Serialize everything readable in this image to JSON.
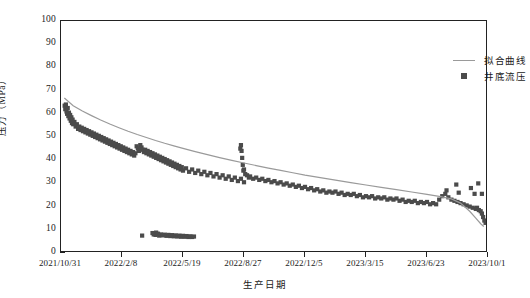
{
  "chart_data": {
    "type": "scatter",
    "title": "",
    "xlabel": "生产日期",
    "ylabel": "压力（MPa）",
    "ylim": [
      0,
      100
    ],
    "ytick_labels": [
      "0",
      "10",
      "20",
      "30",
      "40",
      "50",
      "60",
      "70",
      "80",
      "90",
      "100"
    ],
    "ytick_values": [
      0,
      10,
      20,
      30,
      40,
      50,
      60,
      70,
      80,
      90,
      100
    ],
    "xtick_labels": [
      "2021/10/31",
      "2022/2/8",
      "2022/5/19",
      "2022/8/27",
      "2022/12/5",
      "2023/3/15",
      "2023/6/23",
      "2023/10/1"
    ],
    "xtick_positions": [
      0,
      1,
      2,
      3,
      4,
      5,
      6,
      7
    ],
    "grid": false,
    "legend_position": "top-right",
    "colors": {
      "marker": "#4b4b4b",
      "fit_line": "#9a9a9a",
      "axis": "#222222"
    },
    "series": [
      {
        "name": "拟合曲线",
        "type": "line",
        "color": "#9a9a9a",
        "points": [
          [
            0.055,
            66.8
          ],
          [
            0.2,
            63.5
          ],
          [
            0.35,
            61.2
          ],
          [
            0.5,
            59.2
          ],
          [
            0.65,
            57.3
          ],
          [
            0.8,
            55.6
          ],
          [
            0.95,
            54.0
          ],
          [
            1.1,
            52.5
          ],
          [
            1.25,
            51.1
          ],
          [
            1.4,
            49.8
          ],
          [
            1.55,
            48.5
          ],
          [
            1.7,
            47.3
          ],
          [
            1.85,
            46.2
          ],
          [
            2.0,
            45.1
          ],
          [
            2.2,
            43.7
          ],
          [
            2.4,
            42.4
          ],
          [
            2.6,
            41.1
          ],
          [
            2.8,
            39.9
          ],
          [
            3.0,
            38.8
          ],
          [
            3.2,
            37.7
          ],
          [
            3.4,
            36.6
          ],
          [
            3.6,
            35.6
          ],
          [
            3.8,
            34.6
          ],
          [
            4.0,
            33.6
          ],
          [
            4.25,
            32.5
          ],
          [
            4.5,
            31.4
          ],
          [
            4.75,
            30.3
          ],
          [
            5.0,
            29.3
          ],
          [
            5.25,
            28.3
          ],
          [
            5.5,
            27.3
          ],
          [
            5.75,
            26.3
          ],
          [
            6.0,
            25.3
          ],
          [
            6.2,
            24.4
          ],
          [
            6.4,
            23.3
          ],
          [
            6.55,
            21.5
          ],
          [
            6.7,
            18.0
          ],
          [
            6.8,
            15.0
          ],
          [
            6.88,
            12.6
          ],
          [
            6.93,
            11.4
          ]
        ]
      },
      {
        "name": "井底流压",
        "type": "scatter",
        "color": "#4b4b4b",
        "marker": "square",
        "points": [
          [
            0.06,
            63.5
          ],
          [
            0.07,
            62.0
          ],
          [
            0.08,
            64.0
          ],
          [
            0.09,
            61.0
          ],
          [
            0.1,
            60.0
          ],
          [
            0.11,
            62.5
          ],
          [
            0.12,
            59.0
          ],
          [
            0.13,
            60.5
          ],
          [
            0.14,
            58.0
          ],
          [
            0.15,
            59.5
          ],
          [
            0.16,
            57.0
          ],
          [
            0.17,
            58.5
          ],
          [
            0.18,
            56.0
          ],
          [
            0.19,
            57.5
          ],
          [
            0.2,
            55.5
          ],
          [
            0.22,
            56.5
          ],
          [
            0.24,
            54.5
          ],
          [
            0.26,
            55.5
          ],
          [
            0.28,
            53.5
          ],
          [
            0.3,
            54.5
          ],
          [
            0.32,
            53.0
          ],
          [
            0.34,
            54.0
          ],
          [
            0.36,
            52.5
          ],
          [
            0.38,
            53.5
          ],
          [
            0.4,
            52.0
          ],
          [
            0.42,
            53.0
          ],
          [
            0.44,
            51.5
          ],
          [
            0.46,
            52.5
          ],
          [
            0.48,
            51.0
          ],
          [
            0.5,
            52.0
          ],
          [
            0.52,
            50.5
          ],
          [
            0.54,
            51.5
          ],
          [
            0.56,
            50.0
          ],
          [
            0.58,
            51.0
          ],
          [
            0.6,
            49.5
          ],
          [
            0.62,
            50.5
          ],
          [
            0.64,
            49.0
          ],
          [
            0.66,
            50.0
          ],
          [
            0.68,
            48.5
          ],
          [
            0.7,
            49.5
          ],
          [
            0.72,
            48.0
          ],
          [
            0.74,
            49.0
          ],
          [
            0.76,
            47.5
          ],
          [
            0.78,
            48.5
          ],
          [
            0.8,
            47.0
          ],
          [
            0.82,
            48.0
          ],
          [
            0.84,
            46.5
          ],
          [
            0.86,
            47.5
          ],
          [
            0.88,
            46.0
          ],
          [
            0.9,
            47.0
          ],
          [
            0.92,
            45.5
          ],
          [
            0.94,
            46.5
          ],
          [
            0.96,
            45.0
          ],
          [
            0.98,
            46.0
          ],
          [
            1.0,
            44.5
          ],
          [
            1.02,
            45.5
          ],
          [
            1.04,
            44.0
          ],
          [
            1.06,
            45.0
          ],
          [
            1.08,
            43.5
          ],
          [
            1.1,
            44.5
          ],
          [
            1.12,
            43.0
          ],
          [
            1.14,
            44.0
          ],
          [
            1.16,
            42.5
          ],
          [
            1.18,
            43.5
          ],
          [
            1.2,
            42.0
          ],
          [
            1.22,
            43.0
          ],
          [
            1.24,
            46.0
          ],
          [
            1.26,
            45.0
          ],
          [
            1.28,
            44.0
          ],
          [
            1.3,
            46.5
          ],
          [
            1.32,
            45.5
          ],
          [
            1.34,
            44.5
          ],
          [
            1.36,
            43.5
          ],
          [
            1.38,
            44.5
          ],
          [
            1.4,
            43.0
          ],
          [
            1.42,
            44.0
          ],
          [
            1.44,
            42.5
          ],
          [
            1.46,
            43.5
          ],
          [
            1.48,
            42.0
          ],
          [
            1.5,
            43.0
          ],
          [
            1.52,
            41.5
          ],
          [
            1.54,
            42.5
          ],
          [
            1.56,
            41.0
          ],
          [
            1.58,
            42.0
          ],
          [
            1.6,
            40.5
          ],
          [
            1.62,
            41.5
          ],
          [
            1.64,
            40.0
          ],
          [
            1.66,
            41.0
          ],
          [
            1.68,
            39.5
          ],
          [
            1.7,
            40.5
          ],
          [
            1.72,
            39.0
          ],
          [
            1.74,
            40.0
          ],
          [
            1.76,
            38.5
          ],
          [
            1.78,
            39.5
          ],
          [
            1.8,
            38.0
          ],
          [
            1.82,
            39.0
          ],
          [
            1.84,
            37.5
          ],
          [
            1.86,
            38.5
          ],
          [
            1.88,
            37.0
          ],
          [
            1.9,
            38.0
          ],
          [
            1.92,
            36.5
          ],
          [
            1.94,
            37.5
          ],
          [
            1.96,
            36.0
          ],
          [
            1.98,
            37.0
          ],
          [
            2.0,
            35.5
          ],
          [
            2.05,
            36.5
          ],
          [
            2.1,
            35.0
          ],
          [
            2.15,
            36.0
          ],
          [
            2.2,
            34.5
          ],
          [
            2.25,
            35.5
          ],
          [
            2.3,
            34.0
          ],
          [
            2.35,
            35.0
          ],
          [
            2.4,
            33.5
          ],
          [
            2.45,
            34.5
          ],
          [
            2.5,
            33.0
          ],
          [
            2.55,
            34.0
          ],
          [
            2.6,
            32.5
          ],
          [
            2.65,
            33.5
          ],
          [
            2.7,
            32.0
          ],
          [
            2.75,
            33.0
          ],
          [
            2.8,
            31.5
          ],
          [
            2.85,
            32.5
          ],
          [
            2.9,
            31.0
          ],
          [
            2.95,
            32.0
          ],
          [
            3.0,
            30.5
          ],
          [
            2.96,
            44.0
          ],
          [
            2.97,
            41.0
          ],
          [
            2.98,
            38.0
          ],
          [
            2.99,
            35.5
          ],
          [
            2.95,
            46.5
          ],
          [
            2.94,
            45.0
          ],
          [
            3.0,
            36.0
          ],
          [
            3.02,
            34.0
          ],
          [
            3.05,
            33.5
          ],
          [
            3.08,
            32.5
          ],
          [
            3.1,
            33.0
          ],
          [
            3.15,
            32.0
          ],
          [
            3.2,
            32.5
          ],
          [
            3.25,
            31.5
          ],
          [
            3.3,
            32.0
          ],
          [
            3.35,
            31.0
          ],
          [
            3.4,
            31.5
          ],
          [
            3.45,
            30.5
          ],
          [
            3.5,
            31.0
          ],
          [
            3.55,
            30.0
          ],
          [
            3.6,
            30.5
          ],
          [
            3.65,
            29.5
          ],
          [
            3.7,
            30.0
          ],
          [
            3.75,
            29.0
          ],
          [
            3.8,
            29.5
          ],
          [
            3.85,
            28.5
          ],
          [
            3.9,
            29.0
          ],
          [
            3.95,
            28.0
          ],
          [
            4.0,
            28.5
          ],
          [
            4.05,
            27.5
          ],
          [
            4.1,
            28.0
          ],
          [
            4.15,
            27.0
          ],
          [
            4.2,
            27.5
          ],
          [
            4.25,
            26.5
          ],
          [
            4.3,
            27.0
          ],
          [
            4.35,
            26.0
          ],
          [
            4.4,
            26.5
          ],
          [
            4.45,
            26.0
          ],
          [
            4.5,
            26.5
          ],
          [
            4.55,
            25.5
          ],
          [
            4.6,
            26.0
          ],
          [
            4.65,
            25.0
          ],
          [
            4.7,
            25.5
          ],
          [
            4.75,
            25.0
          ],
          [
            4.8,
            25.5
          ],
          [
            4.85,
            24.5
          ],
          [
            4.9,
            25.0
          ],
          [
            4.95,
            24.0
          ],
          [
            5.0,
            24.5
          ],
          [
            5.05,
            24.0
          ],
          [
            5.1,
            24.5
          ],
          [
            5.15,
            23.5
          ],
          [
            5.2,
            24.0
          ],
          [
            5.25,
            23.5
          ],
          [
            5.3,
            24.0
          ],
          [
            5.35,
            23.0
          ],
          [
            5.4,
            23.5
          ],
          [
            5.45,
            23.0
          ],
          [
            5.5,
            23.5
          ],
          [
            5.55,
            22.5
          ],
          [
            5.6,
            23.0
          ],
          [
            5.65,
            22.0
          ],
          [
            5.7,
            22.5
          ],
          [
            5.75,
            22.0
          ],
          [
            5.8,
            22.5
          ],
          [
            5.85,
            21.5
          ],
          [
            5.9,
            22.0
          ],
          [
            5.95,
            21.5
          ],
          [
            6.0,
            22.0
          ],
          [
            6.05,
            21.0
          ],
          [
            6.1,
            21.5
          ],
          [
            6.15,
            21.0
          ],
          [
            6.2,
            23.0
          ],
          [
            6.25,
            24.5
          ],
          [
            6.3,
            25.5
          ],
          [
            6.32,
            27.0
          ],
          [
            6.35,
            24.0
          ],
          [
            6.4,
            23.0
          ],
          [
            6.45,
            22.5
          ],
          [
            6.5,
            22.0
          ],
          [
            6.55,
            21.5
          ],
          [
            6.6,
            21.0
          ],
          [
            6.65,
            20.5
          ],
          [
            6.7,
            20.0
          ],
          [
            6.75,
            19.5
          ],
          [
            6.8,
            19.0
          ],
          [
            6.82,
            19.5
          ],
          [
            6.85,
            18.5
          ],
          [
            6.88,
            18.0
          ],
          [
            6.9,
            17.0
          ],
          [
            6.92,
            15.5
          ],
          [
            6.94,
            14.0
          ],
          [
            6.96,
            13.0
          ],
          [
            6.48,
            29.5
          ],
          [
            6.52,
            26.0
          ],
          [
            6.72,
            28.0
          ],
          [
            6.78,
            25.5
          ],
          [
            6.84,
            30.0
          ],
          [
            6.9,
            25.5
          ],
          [
            1.33,
            7.5
          ],
          [
            1.52,
            8.0
          ],
          [
            1.55,
            7.8
          ],
          [
            1.58,
            8.2
          ],
          [
            1.61,
            7.5
          ],
          [
            1.64,
            8.0
          ],
          [
            1.67,
            7.6
          ],
          [
            1.7,
            7.9
          ],
          [
            1.73,
            7.4
          ],
          [
            1.76,
            7.8
          ],
          [
            1.79,
            7.3
          ],
          [
            1.82,
            7.7
          ],
          [
            1.85,
            7.2
          ],
          [
            1.88,
            7.6
          ],
          [
            1.91,
            7.1
          ],
          [
            1.94,
            7.5
          ],
          [
            1.97,
            7.0
          ],
          [
            2.0,
            7.4
          ],
          [
            2.03,
            7.0
          ],
          [
            2.06,
            7.3
          ],
          [
            2.09,
            6.9
          ],
          [
            2.12,
            7.2
          ],
          [
            2.15,
            6.9
          ],
          [
            2.18,
            7.1
          ],
          [
            1.5,
            8.6
          ],
          [
            1.53,
            8.4
          ],
          [
            1.56,
            8.8
          ],
          [
            1.59,
            8.3
          ]
        ]
      }
    ]
  },
  "legend": {
    "items": [
      {
        "label": "拟合曲线",
        "marker": "line"
      },
      {
        "label": "井底流压",
        "marker": "square"
      }
    ]
  }
}
